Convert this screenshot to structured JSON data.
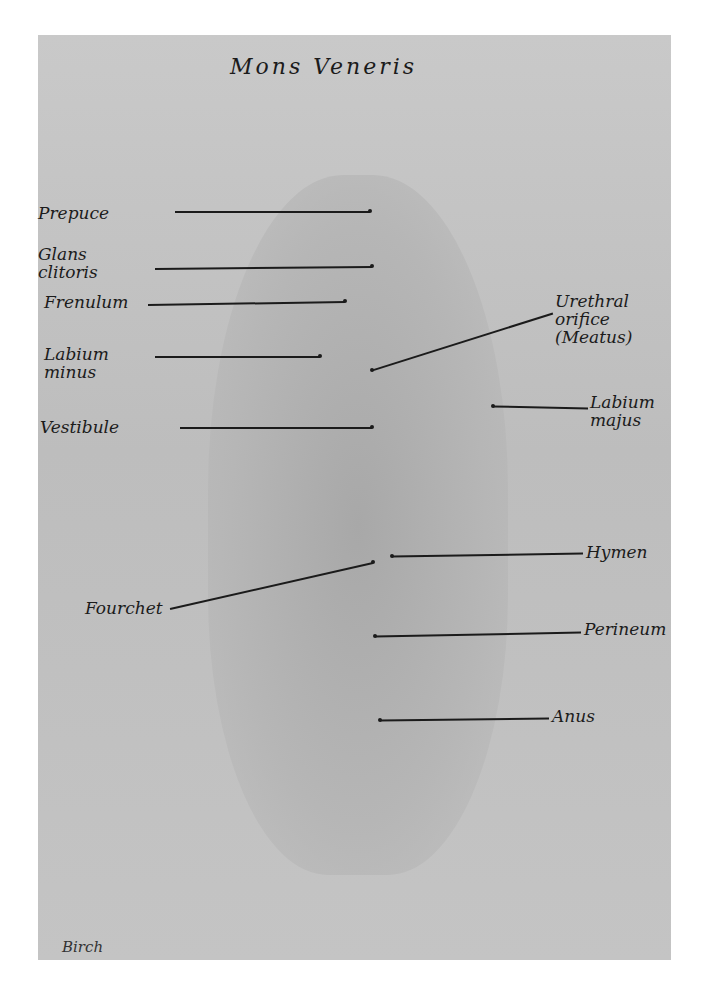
{
  "figure": {
    "title": "Mons Veneris",
    "signature": "Birch"
  },
  "labels": [
    {
      "id": "prepuce",
      "text": "Prepuce",
      "x": 38,
      "y": 204
    },
    {
      "id": "glans-clitoris",
      "text": "Glans\nclitoris",
      "x": 38,
      "y": 245
    },
    {
      "id": "frenulum",
      "text": "Frenulum",
      "x": 44,
      "y": 293
    },
    {
      "id": "labium-minus",
      "text": "Labium\nminus",
      "x": 44,
      "y": 345
    },
    {
      "id": "vestibule",
      "text": "Vestibule",
      "x": 40,
      "y": 418
    },
    {
      "id": "urethral-orifice",
      "text": "Urethral\norifice\n(Meatus)",
      "x": 555,
      "y": 292
    },
    {
      "id": "labium-majus",
      "text": "Labium\nmajus",
      "x": 590,
      "y": 393
    },
    {
      "id": "hymen",
      "text": "Hymen",
      "x": 586,
      "y": 543
    },
    {
      "id": "fourchet",
      "text": "Fourchet",
      "x": 85,
      "y": 599
    },
    {
      "id": "perineum",
      "text": "Perineum",
      "x": 584,
      "y": 620
    },
    {
      "id": "anus",
      "text": "Anus",
      "x": 552,
      "y": 707
    }
  ],
  "leaders": [
    {
      "id": "prepuce",
      "x1": 175,
      "y1": 211,
      "x2": 370,
      "y2": 211
    },
    {
      "id": "glans-clitoris",
      "x1": 155,
      "y1": 268,
      "x2": 372,
      "y2": 266
    },
    {
      "id": "frenulum",
      "x1": 148,
      "y1": 304,
      "x2": 345,
      "y2": 301
    },
    {
      "id": "labium-minus",
      "x1": 155,
      "y1": 356,
      "x2": 320,
      "y2": 356
    },
    {
      "id": "vestibule",
      "x1": 180,
      "y1": 427,
      "x2": 372,
      "y2": 427
    },
    {
      "id": "urethral-orifice",
      "x1": 553,
      "y1": 313,
      "x2": 372,
      "y2": 370
    },
    {
      "id": "labium-majus",
      "x1": 588,
      "y1": 408,
      "x2": 493,
      "y2": 406
    },
    {
      "id": "hymen",
      "x1": 583,
      "y1": 553,
      "x2": 392,
      "y2": 556
    },
    {
      "id": "fourchet",
      "x1": 170,
      "y1": 608,
      "x2": 373,
      "y2": 562
    },
    {
      "id": "perineum",
      "x1": 581,
      "y1": 632,
      "x2": 375,
      "y2": 636
    },
    {
      "id": "anus",
      "x1": 549,
      "y1": 718,
      "x2": 380,
      "y2": 720
    }
  ]
}
